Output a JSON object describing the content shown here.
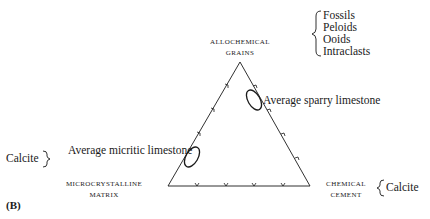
{
  "figure_label": "(B)",
  "vertices": {
    "top": {
      "line1": "ALLOCHEMICAL",
      "line2": "GRAINS"
    },
    "left": {
      "line1": "MICROCRYSTALLINE",
      "line2": "MATRIX"
    },
    "right": {
      "line1": "CHEMICAL",
      "line2": "CEMENT"
    }
  },
  "brace_lists": {
    "top": [
      "Fossils",
      "Peloids",
      "Ooids",
      "Intraclasts"
    ],
    "left": [
      "Calcite"
    ],
    "right": [
      "Calcite"
    ]
  },
  "annotations": {
    "sparry": "Average sparry limestone",
    "micritic": "Average micritic limestone"
  },
  "colors": {
    "ink": "#1a1a1a",
    "background": "#ffffff"
  }
}
